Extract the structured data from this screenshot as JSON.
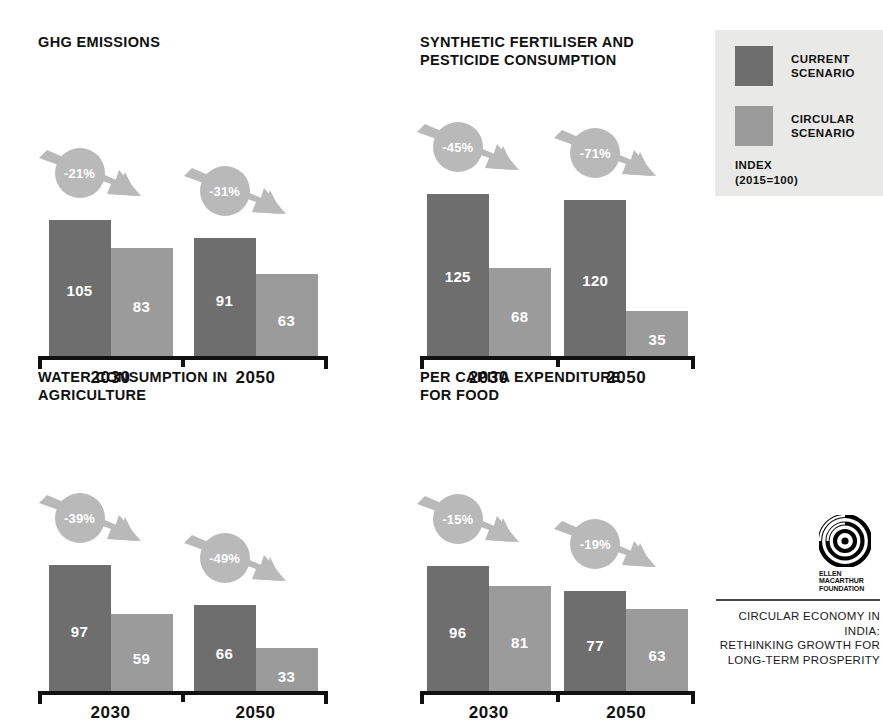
{
  "colors": {
    "current": "#6e6e6e",
    "circular": "#9b9b9b",
    "badge": "#b9b9b9",
    "axis": "#111111",
    "legend_panel": "#e9e9e7",
    "background": "#ffffff",
    "footer_text": "#1a1a1a"
  },
  "legend": {
    "items": [
      {
        "label": "CURRENT\nSCENARIO",
        "color": "#6e6e6e"
      },
      {
        "label": "CIRCULAR\nSCENARIO",
        "color": "#9b9b9b"
      }
    ],
    "index_note": "INDEX\n(2015=100)"
  },
  "logo": {
    "wordmark": "ELLEN\nMACARTHUR\nFOUNDATION",
    "footer": "CIRCULAR ECONOMY IN INDIA:\nRETHINKING GROWTH FOR\nLONG-TERM PROSPERITY"
  },
  "chart_data": [
    {
      "type": "bar",
      "title": "GHG EMISSIONS",
      "categories": [
        "2030",
        "2050"
      ],
      "series": [
        {
          "name": "CURRENT SCENARIO",
          "values": [
            105,
            91
          ]
        },
        {
          "name": "CIRCULAR SCENARIO",
          "values": [
            83,
            63
          ]
        }
      ],
      "annotations": [
        "-21%",
        "-31%"
      ],
      "ylabel": "INDEX (2015=100)",
      "xlabel": "",
      "ylim": [
        0,
        130
      ],
      "grid": false,
      "legend_position": "top-right"
    },
    {
      "type": "bar",
      "title": "SYNTHETIC FERTILISER AND\nPESTICIDE CONSUMPTION",
      "categories": [
        "2030",
        "2050"
      ],
      "series": [
        {
          "name": "CURRENT SCENARIO",
          "values": [
            125,
            120
          ]
        },
        {
          "name": "CIRCULAR SCENARIO",
          "values": [
            68,
            35
          ]
        }
      ],
      "annotations": [
        "-45%",
        "-71%"
      ],
      "ylabel": "INDEX (2015=100)",
      "xlabel": "",
      "ylim": [
        0,
        130
      ],
      "grid": false,
      "legend_position": "top-right"
    },
    {
      "type": "bar",
      "title": "WATER CONSUMPTION IN\nAGRICULTURE",
      "categories": [
        "2030",
        "2050"
      ],
      "series": [
        {
          "name": "CURRENT SCENARIO",
          "values": [
            97,
            66
          ]
        },
        {
          "name": "CIRCULAR SCENARIO",
          "values": [
            59,
            33
          ]
        }
      ],
      "annotations": [
        "-39%",
        "-49%"
      ],
      "ylabel": "INDEX (2015=100)",
      "xlabel": "",
      "ylim": [
        0,
        130
      ],
      "grid": false,
      "legend_position": "top-right"
    },
    {
      "type": "bar",
      "title": "PER CAPITA EXPENDITURE\nFOR FOOD",
      "categories": [
        "2030",
        "2050"
      ],
      "series": [
        {
          "name": "CURRENT SCENARIO",
          "values": [
            96,
            77
          ]
        },
        {
          "name": "CIRCULAR SCENARIO",
          "values": [
            81,
            63
          ]
        }
      ],
      "annotations": [
        "-15%",
        "-19%"
      ],
      "ylabel": "INDEX (2015=100)",
      "xlabel": "",
      "ylim": [
        0,
        130
      ],
      "grid": false,
      "legend_position": "top-right"
    }
  ]
}
